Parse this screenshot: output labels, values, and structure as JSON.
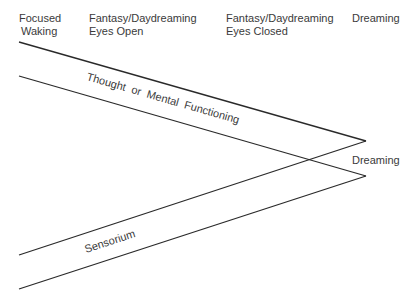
{
  "headers": [
    {
      "line1": "Focused",
      "line2": "Waking"
    },
    {
      "line1": "Fantasy/Daydreaming",
      "line2": "Eyes Open"
    },
    {
      "line1": "Fantasy/Daydreaming",
      "line2": "Eyes Closed"
    },
    {
      "line1": "Dreaming",
      "line2": ""
    }
  ],
  "bands": {
    "thought": {
      "label": "Thought  or  Mental  Functioning"
    },
    "sensorium": {
      "label": "Sensorium"
    }
  },
  "convergence_label": "Dreaming",
  "colors": {
    "line": "#2a2a2a",
    "text": "#3a3a3a"
  }
}
